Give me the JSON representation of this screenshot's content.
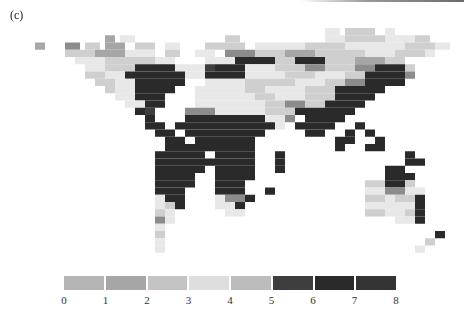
{
  "panel_label": "(c)",
  "legend": {
    "tick_labels": [
      "0",
      "1",
      "2",
      "3",
      "4",
      "5",
      "6",
      "7",
      "8"
    ],
    "swatch_colors": [
      "#b4b4b4",
      "#a6a6a6",
      "#c4c4c4",
      "#dedede",
      "#bcbcbc",
      "#3e3e3e",
      "#2a2a2a",
      "#343434"
    ]
  },
  "map": {
    "cell_size": 5,
    "origin_x": 5,
    "origin_y": 28,
    "palette": {
      "0": "#b4b4b4",
      "1": "#a6a6a6",
      "2": "#c4c4c4",
      "3": "#dedede",
      "4": "#bcbcbc",
      "5": "#3e3e3e",
      "6": "#2a2a2a",
      "7": "#343434",
      "L": "#e8e8e8",
      "M": "#cfcfcf",
      "D": "#8c8c8c"
    },
    "rows": [
      [
        [
          64,
          3,
          "L"
        ],
        [
          68,
          6,
          "M"
        ],
        [
          76,
          2,
          "L"
        ]
      ],
      [
        [
          20,
          2,
          "1"
        ],
        [
          23,
          3,
          "L"
        ],
        [
          44,
          3,
          "M"
        ],
        [
          64,
          4,
          "L"
        ],
        [
          68,
          8,
          "M"
        ],
        [
          76,
          6,
          "L"
        ],
        [
          82,
          3,
          "M"
        ]
      ],
      [
        [
          6,
          2,
          "1"
        ],
        [
          12,
          3,
          "D"
        ],
        [
          16,
          3,
          "M"
        ],
        [
          20,
          4,
          "1"
        ],
        [
          26,
          4,
          "M"
        ],
        [
          32,
          3,
          "L"
        ],
        [
          40,
          8,
          "M"
        ],
        [
          50,
          10,
          "L"
        ],
        [
          60,
          8,
          "M"
        ],
        [
          68,
          12,
          "L"
        ],
        [
          80,
          6,
          "M"
        ],
        [
          86,
          3,
          "L"
        ]
      ],
      [
        [
          12,
          6,
          "M"
        ],
        [
          18,
          6,
          "1"
        ],
        [
          24,
          6,
          "L"
        ],
        [
          32,
          3,
          "M"
        ],
        [
          38,
          4,
          "L"
        ],
        [
          44,
          6,
          "D"
        ],
        [
          50,
          6,
          "M"
        ],
        [
          56,
          6,
          "1"
        ],
        [
          62,
          10,
          "M"
        ],
        [
          72,
          6,
          "L"
        ],
        [
          78,
          6,
          "M"
        ],
        [
          84,
          2,
          "L"
        ]
      ],
      [
        [
          14,
          6,
          "L"
        ],
        [
          20,
          10,
          "M"
        ],
        [
          30,
          4,
          "L"
        ],
        [
          40,
          6,
          "L"
        ],
        [
          46,
          8,
          "6"
        ],
        [
          54,
          4,
          "M"
        ],
        [
          58,
          6,
          "6"
        ],
        [
          64,
          6,
          "M"
        ],
        [
          70,
          6,
          "1"
        ],
        [
          76,
          4,
          "M"
        ]
      ],
      [
        [
          16,
          4,
          "L"
        ],
        [
          20,
          6,
          "M"
        ],
        [
          26,
          8,
          "6"
        ],
        [
          34,
          6,
          "L"
        ],
        [
          40,
          2,
          "5"
        ],
        [
          42,
          6,
          "6"
        ],
        [
          48,
          6,
          "L"
        ],
        [
          54,
          6,
          "M"
        ],
        [
          60,
          4,
          "D"
        ],
        [
          64,
          6,
          "M"
        ],
        [
          70,
          4,
          "D"
        ],
        [
          74,
          6,
          "6"
        ],
        [
          80,
          2,
          "M"
        ]
      ],
      [
        [
          16,
          4,
          "M"
        ],
        [
          20,
          4,
          "L"
        ],
        [
          24,
          2,
          "6"
        ],
        [
          26,
          10,
          "6"
        ],
        [
          36,
          4,
          "L"
        ],
        [
          40,
          8,
          "6"
        ],
        [
          48,
          8,
          "L"
        ],
        [
          56,
          6,
          "M"
        ],
        [
          62,
          6,
          "L"
        ],
        [
          68,
          4,
          "M"
        ],
        [
          72,
          8,
          "6"
        ],
        [
          80,
          2,
          "D"
        ]
      ],
      [
        [
          18,
          4,
          "M"
        ],
        [
          22,
          4,
          "L"
        ],
        [
          26,
          10,
          "6"
        ],
        [
          40,
          8,
          "L"
        ],
        [
          48,
          10,
          "M"
        ],
        [
          58,
          6,
          "L"
        ],
        [
          64,
          4,
          "M"
        ],
        [
          68,
          4,
          "D"
        ],
        [
          72,
          6,
          "6"
        ],
        [
          78,
          2,
          "6"
        ]
      ],
      [
        [
          20,
          2,
          "M"
        ],
        [
          22,
          4,
          "L"
        ],
        [
          26,
          8,
          "6"
        ],
        [
          38,
          10,
          "L"
        ],
        [
          48,
          4,
          "M"
        ],
        [
          52,
          8,
          "L"
        ],
        [
          60,
          6,
          "M"
        ],
        [
          66,
          2,
          "6"
        ],
        [
          68,
          8,
          "6"
        ]
      ],
      [
        [
          22,
          4,
          "L"
        ],
        [
          26,
          6,
          "6"
        ],
        [
          38,
          12,
          "L"
        ],
        [
          50,
          4,
          "M"
        ],
        [
          54,
          6,
          "L"
        ],
        [
          60,
          6,
          "M"
        ],
        [
          66,
          8,
          "6"
        ]
      ],
      [
        [
          24,
          4,
          "L"
        ],
        [
          28,
          4,
          "6"
        ],
        [
          38,
          14,
          "L"
        ],
        [
          52,
          4,
          "M"
        ],
        [
          56,
          4,
          "D"
        ],
        [
          60,
          4,
          "M"
        ],
        [
          64,
          8,
          "6"
        ]
      ],
      [
        [
          26,
          2,
          "6"
        ],
        [
          28,
          2,
          "5"
        ],
        [
          36,
          6,
          "D"
        ],
        [
          42,
          10,
          "L"
        ],
        [
          52,
          6,
          "M"
        ],
        [
          58,
          2,
          "6"
        ],
        [
          60,
          10,
          "6"
        ]
      ],
      [
        [
          28,
          2,
          "6"
        ],
        [
          36,
          16,
          "6"
        ],
        [
          52,
          4,
          "L"
        ],
        [
          56,
          2,
          "D"
        ],
        [
          60,
          8,
          "6"
        ]
      ],
      [
        [
          28,
          4,
          "6"
        ],
        [
          34,
          20,
          "6"
        ],
        [
          54,
          2,
          "L"
        ],
        [
          58,
          8,
          "6"
        ],
        [
          70,
          2,
          "6"
        ]
      ],
      [
        [
          30,
          4,
          "6"
        ],
        [
          36,
          16,
          "6"
        ],
        [
          60,
          4,
          "6"
        ],
        [
          68,
          2,
          "6"
        ],
        [
          72,
          2,
          "6"
        ]
      ],
      [
        [
          32,
          4,
          "6"
        ],
        [
          38,
          12,
          "6"
        ],
        [
          66,
          4,
          "6"
        ],
        [
          74,
          2,
          "6"
        ]
      ],
      [
        [
          32,
          8,
          "6"
        ],
        [
          40,
          10,
          "6"
        ],
        [
          66,
          2,
          "6"
        ],
        [
          72,
          4,
          "6"
        ]
      ],
      [
        [
          30,
          10,
          "6"
        ],
        [
          42,
          8,
          "6"
        ],
        [
          54,
          2,
          "6"
        ],
        [
          80,
          2,
          "6"
        ]
      ],
      [
        [
          30,
          12,
          "6"
        ],
        [
          42,
          8,
          "6"
        ],
        [
          54,
          2,
          "6"
        ],
        [
          80,
          4,
          "6"
        ]
      ],
      [
        [
          30,
          10,
          "6"
        ],
        [
          42,
          8,
          "6"
        ],
        [
          54,
          2,
          "6"
        ],
        [
          76,
          4,
          "6"
        ]
      ],
      [
        [
          30,
          8,
          "6"
        ],
        [
          42,
          8,
          "6"
        ],
        [
          76,
          6,
          "6"
        ]
      ],
      [
        [
          30,
          8,
          "6"
        ],
        [
          42,
          6,
          "6"
        ],
        [
          72,
          4,
          "M"
        ],
        [
          76,
          4,
          "6"
        ],
        [
          80,
          2,
          "M"
        ]
      ],
      [
        [
          30,
          6,
          "6"
        ],
        [
          42,
          6,
          "6"
        ],
        [
          52,
          2,
          "6"
        ],
        [
          72,
          4,
          "L"
        ],
        [
          76,
          4,
          "D"
        ],
        [
          80,
          4,
          "L"
        ]
      ],
      [
        [
          30,
          2,
          "L"
        ],
        [
          32,
          4,
          "6"
        ],
        [
          42,
          2,
          "L"
        ],
        [
          44,
          4,
          "D"
        ],
        [
          48,
          2,
          "6"
        ],
        [
          72,
          4,
          "M"
        ],
        [
          76,
          2,
          "L"
        ],
        [
          78,
          4,
          "M"
        ],
        [
          82,
          2,
          "6"
        ]
      ],
      [
        [
          30,
          2,
          "L"
        ],
        [
          32,
          2,
          "M"
        ],
        [
          34,
          2,
          "6"
        ],
        [
          42,
          4,
          "L"
        ],
        [
          46,
          2,
          "6"
        ],
        [
          72,
          2,
          "L"
        ],
        [
          74,
          8,
          "L"
        ],
        [
          82,
          2,
          "6"
        ]
      ],
      [
        [
          30,
          2,
          "M"
        ],
        [
          32,
          2,
          "L"
        ],
        [
          44,
          4,
          "L"
        ],
        [
          72,
          4,
          "M"
        ],
        [
          76,
          4,
          "L"
        ],
        [
          80,
          2,
          "M"
        ],
        [
          82,
          2,
          "6"
        ]
      ],
      [
        [
          30,
          2,
          "D"
        ],
        [
          32,
          2,
          "L"
        ],
        [
          78,
          4,
          "L"
        ],
        [
          82,
          2,
          "6"
        ]
      ],
      [
        [
          30,
          2,
          "L"
        ]
      ],
      [
        [
          30,
          2,
          "M"
        ],
        [
          86,
          2,
          "6"
        ]
      ],
      [
        [
          30,
          2,
          "L"
        ],
        [
          84,
          2,
          "M"
        ]
      ],
      [
        [
          30,
          2,
          "L"
        ],
        [
          82,
          2,
          "L"
        ]
      ]
    ]
  }
}
